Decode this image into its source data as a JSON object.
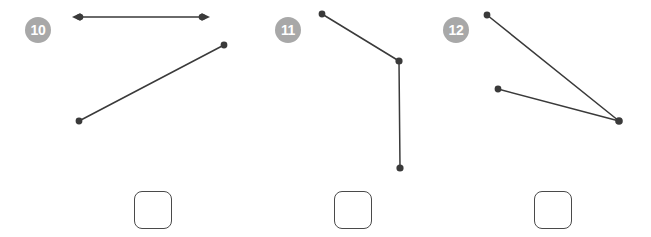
{
  "worksheet": {
    "background_color": "#ffffff",
    "ink_color": "#3a3a3a",
    "badge_color": "#a8a8a8",
    "badge_text_color": "#ffffff",
    "box_border_color": "#4a4a4a"
  },
  "problems": [
    {
      "number": "10",
      "badge_name": "problem-number-10",
      "figure_name": "geometry-figure-10",
      "answer_value": "",
      "answer_placeholder": "",
      "geometry": {
        "points": [
          {
            "name": "point-a",
            "x": 78,
            "y": 17
          },
          {
            "name": "point-b",
            "x": 204,
            "y": 17
          },
          {
            "name": "point-c",
            "x": 79,
            "y": 121
          },
          {
            "name": "point-d",
            "x": 224,
            "y": 45
          }
        ],
        "shapes": [
          {
            "name": "line-with-double-arrow",
            "type": "line",
            "from": [
              78,
              17
            ],
            "to": [
              204,
              17
            ],
            "arrow_start": true,
            "arrow_end": true
          },
          {
            "name": "line-segment",
            "type": "segment",
            "from": [
              79,
              121
            ],
            "to": [
              224,
              45
            ],
            "arrow_start": false,
            "arrow_end": false
          }
        ]
      }
    },
    {
      "number": "11",
      "badge_name": "problem-number-11",
      "figure_name": "geometry-figure-11",
      "answer_value": "",
      "answer_placeholder": "",
      "geometry": {
        "points": [
          {
            "name": "point-endpoint-top",
            "x": 105,
            "y": 14
          },
          {
            "name": "point-vertex",
            "x": 182,
            "y": 61
          },
          {
            "name": "point-endpoint-bottom",
            "x": 183,
            "y": 168
          }
        ],
        "shapes": [
          {
            "name": "segment-upper",
            "type": "segment",
            "from": [
              105,
              14
            ],
            "to": [
              182,
              61
            ],
            "arrow_start": false,
            "arrow_end": false
          },
          {
            "name": "segment-lower",
            "type": "segment",
            "from": [
              182,
              61
            ],
            "to": [
              183,
              168
            ],
            "arrow_start": false,
            "arrow_end": false
          }
        ]
      }
    },
    {
      "number": "12",
      "badge_name": "problem-number-12",
      "figure_name": "geometry-figure-12",
      "answer_value": "",
      "answer_placeholder": "",
      "geometry": {
        "points": [
          {
            "name": "point-upper-left",
            "x": 53,
            "y": 15
          },
          {
            "name": "point-lower-left",
            "x": 64,
            "y": 89
          },
          {
            "name": "point-vertex-right",
            "x": 185,
            "y": 121
          }
        ],
        "shapes": [
          {
            "name": "segment-upper-ray",
            "type": "segment",
            "from": [
              53,
              15
            ],
            "to": [
              185,
              121
            ],
            "arrow_start": false,
            "arrow_end": false
          },
          {
            "name": "segment-lower-ray",
            "type": "segment",
            "from": [
              64,
              89
            ],
            "to": [
              185,
              121
            ],
            "arrow_start": false,
            "arrow_end": false
          }
        ]
      }
    }
  ]
}
